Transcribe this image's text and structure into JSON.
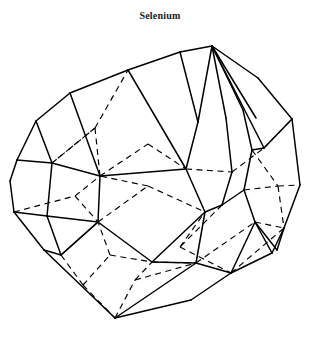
{
  "figure": {
    "title": "Selenium",
    "line_color": "#000000",
    "background_color": "#ffffff",
    "title_color": "#1a1a1a",
    "hidden_edge_style": "dashed",
    "visible_edge_style": "solid",
    "canvas": {
      "width": 320,
      "height": 349
    }
  },
  "geometry": {
    "front_outline": "M 212 46 L 258 78 L 292 119 L 300 185 L 284 228 L 272 253 L 231 273 L 191 300 L 115 318 L 44 250 L 14 212 L 10 181 L 17 160 L 36 121 L 70 93 L 128 70 L 180 52 Z",
    "visible_edges": [
      "M 212 46 L 258 78",
      "M 258 78 L 292 119",
      "M 292 119 L 300 185",
      "M 300 185 L 284 228",
      "M 284 228 L 272 253",
      "M 272 253 L 231 273",
      "M 231 273 L 191 300",
      "M 191 300 L 115 318",
      "M 115 318 L 44 250",
      "M 44 250 L 14 212",
      "M 14 212 L 10 181",
      "M 10 181 L 17 160",
      "M 17 160 L 36 121",
      "M 36 121 L 70 93",
      "M 70 93 L 128 70",
      "M 128 70 L 180 52",
      "M 180 52 L 212 46",
      "M 212 46 L 198 122",
      "M 212 46 L 226 118",
      "M 212 46 L 243 110",
      "M 212 46 L 256 118",
      "M 212 46 L 264 148",
      "M 198 122 L 186 169",
      "M 226 118 L 232 172",
      "M 243 110 L 252 150",
      "M 186 169 L 205 212",
      "M 232 172 L 222 205",
      "M 205 212 L 222 205",
      "M 205 212 L 196 263",
      "M 252 150 L 264 148",
      "M 252 150 L 244 190",
      "M 244 190 L 255 222",
      "M 222 205 L 244 190",
      "M 255 222 L 277 250",
      "M 196 263 L 231 273",
      "M 196 263 L 152 262",
      "M 36 121 L 52 163",
      "M 52 163 L 47 216",
      "M 17 160 L 52 163",
      "M 14 212 L 47 216",
      "M 52 163 L 100 176",
      "M 100 176 L 98 222",
      "M 47 216 L 98 222",
      "M 98 222 L 152 262",
      "M 47 216 L 61 255",
      "M 61 255 L 98 222",
      "M 70 93 L 100 176",
      "M 128 70 L 186 169",
      "M 180 52 L 198 122",
      "M 100 176 L 186 169",
      "M 152 262 L 205 212",
      "M 98 222 L 61 255",
      "M 44 250 L 61 255",
      "M 277 250 L 284 228",
      "M 264 148 L 292 119",
      "M 255 222 L 272 253",
      "M 231 273 L 255 222",
      "M 196 263 L 115 318"
    ],
    "hidden_edges": [
      "M 52 163 L 95 128",
      "M 95 128 L 128 70",
      "M 95 128 L 100 176",
      "M 100 176 L 148 144",
      "M 148 144 L 186 169",
      "M 186 169 L 232 172",
      "M 232 172 L 264 148",
      "M 264 148 L 292 119",
      "M 98 222 L 148 186",
      "M 148 186 L 100 176",
      "M 148 186 L 205 212",
      "M 95 128 L 52 163",
      "M 75 196 L 98 222",
      "M 75 196 L 100 176",
      "M 14 212 L 75 196",
      "M 61 255 L 83 285",
      "M 83 285 L 115 318",
      "M 83 285 L 110 255",
      "M 110 255 L 152 262",
      "M 152 262 L 196 263",
      "M 196 263 L 255 222",
      "M 255 222 L 284 228",
      "M 110 255 L 98 222",
      "M 115 318 L 135 280",
      "M 135 280 L 152 262",
      "M 135 280 L 196 263",
      "M 180 247 L 205 212",
      "M 180 247 L 231 273",
      "M 231 273 L 284 228",
      "M 244 190 L 278 186",
      "M 278 186 L 300 185",
      "M 278 186 L 284 228",
      "M 252 150 L 278 186",
      "M 222 205 L 180 247"
    ]
  }
}
